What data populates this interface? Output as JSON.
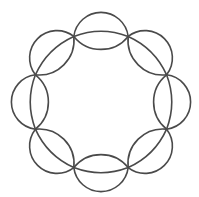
{
  "diagram": {
    "type": "interlocking-lens-ring",
    "center": [
      101,
      102
    ],
    "point_radius": 71,
    "point_count": 8,
    "start_angle_deg": -112.5,
    "outer_sagitta": 24,
    "inner_sagitta": 13,
    "ring_sagitta": 5,
    "stroke_color": "#4a4a4a",
    "stroke_width": 1.6,
    "background": "#ffffff"
  }
}
